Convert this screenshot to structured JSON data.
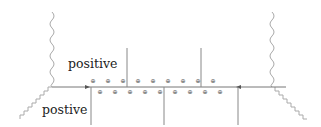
{
  "diagram": {
    "labels": {
      "upper": "positive",
      "lower": "postive"
    },
    "colors": {
      "line": "#777777",
      "photon": "#aaaaaa",
      "text": "#222222",
      "symbol": "#555555"
    },
    "charge_symbol": "⊕",
    "charge_rows": {
      "top": {
        "y": 81,
        "x": [
          93,
          108,
          123,
          138,
          153,
          168,
          183,
          198,
          213
        ]
      },
      "bottom": {
        "y": 92,
        "x": [
          100,
          115,
          130,
          145,
          160,
          175,
          190,
          205,
          220
        ]
      }
    }
  }
}
